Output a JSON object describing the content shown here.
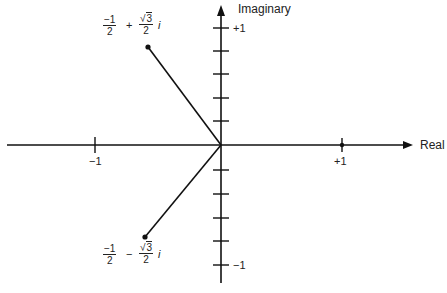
{
  "axes": {
    "horizontal_label": "Real",
    "vertical_label": "Imaginary",
    "real_ticks": {
      "neg": "−1",
      "pos": "+1"
    },
    "imag_ticks": {
      "pos": "+1",
      "neg": "−1"
    }
  },
  "points": [
    {
      "name": "upper-root",
      "real_num": "−1",
      "real_den": "2",
      "op": "+",
      "imag_num_radical": "3",
      "imag_num_prefix": "√",
      "imag_den": "2",
      "unit": "i"
    },
    {
      "name": "lower-root",
      "real_num": "−1",
      "real_den": "2",
      "op": "−",
      "imag_num_radical": "3",
      "imag_num_prefix": "√",
      "imag_den": "2",
      "unit": "i"
    }
  ],
  "colors": {
    "ink": "#111111",
    "background": "#ffffff"
  }
}
